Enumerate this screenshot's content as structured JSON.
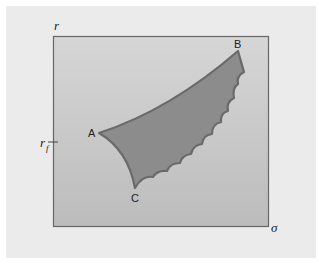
{
  "figure": {
    "y_axis_label": "r",
    "x_axis_label": "σ",
    "risk_free_label": "r",
    "risk_free_subscript": "f",
    "points": [
      {
        "label": "A",
        "description": "minimum-variance point"
      },
      {
        "label": "B",
        "description": "maximum-return point"
      },
      {
        "label": "C",
        "description": "lowest point of feasible set"
      }
    ],
    "colors": {
      "panel_bg": "#ebebeb",
      "plot_bg": "#c3c3c3",
      "region_fill": "#8c8c8c",
      "region_stroke": "#6a6a6a",
      "frame": "#666666"
    }
  }
}
